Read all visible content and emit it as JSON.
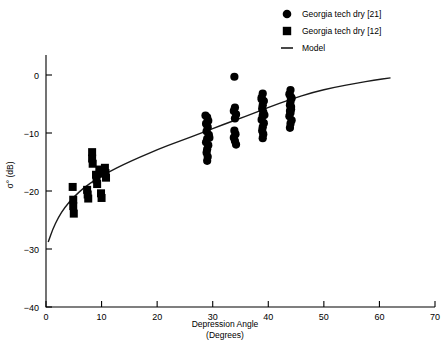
{
  "chart_data": {
    "type": "scatter",
    "title": "",
    "xlabel": "Depression Angle",
    "xlabel_units": "(Degrees)",
    "ylabel": "σ° (dB)",
    "xlim": [
      0,
      70
    ],
    "ylim": [
      -40,
      5
    ],
    "xticks": [
      0,
      10,
      20,
      30,
      40,
      50,
      60,
      70
    ],
    "xtick_labels": [
      "0",
      "10",
      "20",
      "30",
      "40",
      "50",
      "60",
      "70"
    ],
    "yticks": [
      0,
      -10,
      -20,
      -30,
      -40
    ],
    "ytick_labels": [
      "0",
      "−10",
      "−20",
      "−30",
      "−40"
    ],
    "grid": false,
    "legend_position": "top-right",
    "series": [
      {
        "name": "Georgia tech dry  [21]",
        "marker": "circle",
        "color": "#000000",
        "points": [
          [
            29.0,
            -7.3
          ],
          [
            29.2,
            -7.9
          ],
          [
            28.8,
            -8.4
          ],
          [
            29.1,
            -9.0
          ],
          [
            28.9,
            -9.7
          ],
          [
            29.3,
            -10.3
          ],
          [
            29.0,
            -11.0
          ],
          [
            28.8,
            -11.6
          ],
          [
            29.2,
            -12.1
          ],
          [
            29.0,
            -12.8
          ],
          [
            28.9,
            -13.4
          ],
          [
            29.1,
            -14.1
          ],
          [
            29.0,
            -14.8
          ],
          [
            28.7,
            -7.0
          ],
          [
            29.4,
            -10.8
          ],
          [
            33.9,
            -0.3
          ],
          [
            34.0,
            -5.6
          ],
          [
            33.8,
            -6.2
          ],
          [
            34.2,
            -6.8
          ],
          [
            34.0,
            -7.5
          ],
          [
            33.9,
            -9.6
          ],
          [
            34.1,
            -10.2
          ],
          [
            33.8,
            -10.8
          ],
          [
            34.0,
            -11.4
          ],
          [
            34.2,
            -12.0
          ],
          [
            39.0,
            -3.2
          ],
          [
            38.8,
            -3.9
          ],
          [
            39.2,
            -4.5
          ],
          [
            39.0,
            -5.2
          ],
          [
            38.9,
            -5.8
          ],
          [
            39.1,
            -6.4
          ],
          [
            39.0,
            -7.0
          ],
          [
            38.8,
            -7.7
          ],
          [
            39.2,
            -8.3
          ],
          [
            39.0,
            -9.0
          ],
          [
            38.9,
            -9.6
          ],
          [
            39.1,
            -10.2
          ],
          [
            39.0,
            -10.9
          ],
          [
            38.8,
            -4.2
          ],
          [
            39.3,
            -6.9
          ],
          [
            44.0,
            -2.6
          ],
          [
            43.8,
            -3.3
          ],
          [
            44.2,
            -4.0
          ],
          [
            44.0,
            -4.6
          ],
          [
            43.9,
            -5.2
          ],
          [
            44.1,
            -5.9
          ],
          [
            44.0,
            -6.5
          ],
          [
            43.8,
            -7.1
          ],
          [
            44.2,
            -7.8
          ],
          [
            44.0,
            -8.4
          ],
          [
            43.9,
            -9.1
          ],
          [
            44.1,
            -5.5
          ],
          [
            44.0,
            -3.7
          ],
          [
            43.9,
            -6.2
          ]
        ]
      },
      {
        "name": "Georgia tech dry  [12]",
        "marker": "square",
        "color": "#000000",
        "points": [
          [
            4.8,
            -19.3
          ],
          [
            4.9,
            -21.5
          ],
          [
            4.9,
            -22.6
          ],
          [
            5.0,
            -23.9
          ],
          [
            7.4,
            -19.8
          ],
          [
            7.5,
            -20.6
          ],
          [
            7.6,
            -21.3
          ],
          [
            8.3,
            -13.3
          ],
          [
            8.3,
            -14.4
          ],
          [
            8.4,
            -15.3
          ],
          [
            9.0,
            -17.2
          ],
          [
            9.1,
            -18.0
          ],
          [
            9.2,
            -18.8
          ],
          [
            9.6,
            -16.3
          ],
          [
            9.7,
            -17.0
          ],
          [
            10.6,
            -16.0
          ],
          [
            10.7,
            -16.9
          ],
          [
            10.8,
            -17.7
          ],
          [
            9.9,
            -20.4
          ],
          [
            10.0,
            -21.2
          ]
        ]
      }
    ],
    "model": {
      "name": "Model",
      "color": "#1a1a1a",
      "points": [
        [
          0.4,
          -28.8
        ],
        [
          1.2,
          -26.6
        ],
        [
          2.2,
          -24.6
        ],
        [
          3.4,
          -22.8
        ],
        [
          5.0,
          -21.0
        ],
        [
          7.0,
          -19.3
        ],
        [
          9.0,
          -18.0
        ],
        [
          11.5,
          -16.6
        ],
        [
          14.0,
          -15.4
        ],
        [
          17.0,
          -14.1
        ],
        [
          20.0,
          -12.9
        ],
        [
          24.0,
          -11.4
        ],
        [
          28.0,
          -10.0
        ],
        [
          32.0,
          -8.5
        ],
        [
          36.0,
          -7.1
        ],
        [
          40.0,
          -5.6
        ],
        [
          44.0,
          -4.2
        ],
        [
          48.0,
          -3.0
        ],
        [
          52.0,
          -2.1
        ],
        [
          56.0,
          -1.4
        ],
        [
          59.0,
          -0.9
        ],
        [
          62.0,
          -0.5
        ]
      ]
    }
  },
  "legend": {
    "items": [
      {
        "label": "Georgia tech dry  [21]",
        "marker": "circle"
      },
      {
        "label": "Georgia tech dry  [12]",
        "marker": "square"
      },
      {
        "label": "Model",
        "marker": "line"
      }
    ]
  }
}
